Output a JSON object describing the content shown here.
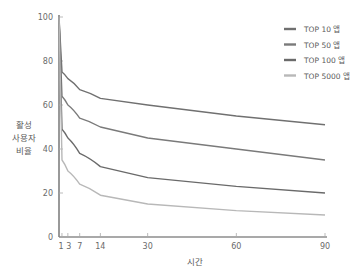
{
  "chart_data": {
    "type": "line",
    "title": "",
    "xlabel": "시간",
    "ylabel": [
      "활성",
      "사용자",
      "비율"
    ],
    "xlim": [
      0,
      90
    ],
    "ylim": [
      0,
      100
    ],
    "x_ticks": [
      1,
      3,
      7,
      14,
      30,
      60,
      90
    ],
    "y_ticks": [
      0,
      20,
      40,
      60,
      80,
      100
    ],
    "grid": false,
    "legend_position": "top-right",
    "x": [
      0,
      1,
      3,
      7,
      14,
      30,
      60,
      90
    ],
    "series": [
      {
        "name": "TOP 10 앱",
        "color": "#707070",
        "values": [
          100,
          75,
          72,
          67,
          63,
          60,
          55,
          51
        ]
      },
      {
        "name": "TOP 50 앱",
        "color": "#7a7a7a",
        "values": [
          100,
          64,
          60,
          54,
          50,
          45,
          40,
          35
        ]
      },
      {
        "name": "TOP 100 앱",
        "color": "#6a6a6a",
        "values": [
          100,
          49,
          45,
          38,
          32,
          27,
          23,
          20
        ]
      },
      {
        "name": "TOP 5000 앱",
        "color": "#b8b8b8",
        "values": [
          100,
          35,
          30,
          24,
          19,
          15,
          12,
          10
        ]
      }
    ]
  }
}
